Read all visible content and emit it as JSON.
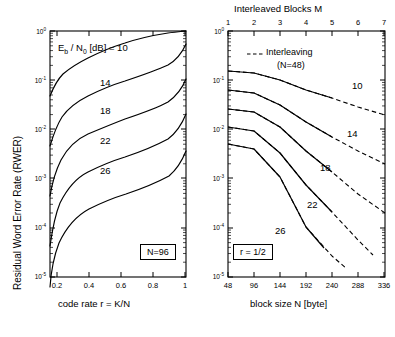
{
  "figure": {
    "left_panel": {
      "xlabel": "code rate   r = K/N",
      "ylabel": "Residual Word Error Rate (RWER)",
      "xticks": [
        "0.2",
        "0.4",
        "0.6",
        "0.8",
        "1"
      ],
      "yticks": [
        "10",
        "10",
        "10",
        "10",
        "10",
        "10"
      ],
      "yexp": [
        "0",
        "-1",
        "-2",
        "-3",
        "-4",
        "-5"
      ],
      "annotation_prefix": "E",
      "annotation_sub": "b",
      "annotation_mid": " / N",
      "annotation_sub2": "0",
      "annotation_suffix": " [dB] = 10",
      "box_note": "N=96",
      "curve_labels": [
        "14",
        "18",
        "22",
        "26"
      ]
    },
    "right_panel": {
      "title": "Interleaved Blocks M",
      "xlabel": "block size N [byte]",
      "xticks": [
        "48",
        "96",
        "144",
        "192",
        "240",
        "288",
        "336"
      ],
      "topticks": [
        "1",
        "2",
        "3",
        "4",
        "5",
        "6",
        "7"
      ],
      "yticks": [
        "10",
        "10",
        "10",
        "10",
        "10",
        "10"
      ],
      "yexp": [
        "0",
        "-1",
        "-2",
        "-3",
        "-4",
        "-5"
      ],
      "legend_line1": "Interleaving",
      "legend_line2": "(N=48)",
      "box_note": "r = 1/2",
      "curve_labels": [
        "10",
        "14",
        "18",
        "22",
        "26"
      ]
    }
  },
  "chart_data": [
    {
      "type": "line",
      "title": "",
      "xlabel": "code rate   r = K/N",
      "ylabel": "Residual Word Error Rate (RWER)",
      "xlim": [
        0.15,
        1.0
      ],
      "ylim": [
        1e-05,
        1
      ],
      "yscale": "log",
      "grid": false,
      "legend_position": "inline-labels",
      "annotation": "Eb / N0 [dB] = 10",
      "box_note": "N=96",
      "x": [
        0.16,
        0.2,
        0.25,
        0.3,
        0.35,
        0.4,
        0.5,
        0.6,
        0.7,
        0.8,
        0.9,
        0.95,
        1.0
      ],
      "series": [
        {
          "name": "10",
          "values": [
            0.047,
            0.072,
            0.1,
            0.125,
            0.15,
            0.175,
            0.22,
            0.27,
            0.33,
            0.41,
            0.54,
            0.65,
            0.85
          ]
        },
        {
          "name": "14",
          "values": [
            0.0105,
            0.019,
            0.03,
            0.042,
            0.053,
            0.063,
            0.085,
            0.108,
            0.14,
            0.185,
            0.26,
            0.33,
            0.52
          ]
        },
        {
          "name": "18",
          "values": [
            0.0028,
            0.006,
            0.0105,
            0.0152,
            0.0198,
            0.0242,
            0.034,
            0.045,
            0.06,
            0.082,
            0.12,
            0.16,
            0.27
          ]
        },
        {
          "name": "22",
          "values": [
            0.00072,
            0.0018,
            0.0035,
            0.0053,
            0.0072,
            0.009,
            0.0131,
            0.0178,
            0.0245,
            0.0345,
            0.052,
            0.071,
            0.125
          ]
        },
        {
          "name": "26",
          "values": [
            0.00018,
            0.00052,
            0.00112,
            0.00178,
            0.00248,
            0.00318,
            0.0048,
            0.0067,
            0.0094,
            0.0136,
            0.021,
            0.029,
            0.053
          ]
        }
      ]
    },
    {
      "type": "line",
      "title": "Interleaved Blocks M",
      "xlabel": "block size N [byte]",
      "ylabel": "",
      "xlim": [
        48,
        336
      ],
      "ylim": [
        1e-05,
        1
      ],
      "yscale": "log",
      "grid": false,
      "top_axis": {
        "label": "Interleaved Blocks M",
        "ticks": [
          1,
          2,
          3,
          4,
          5,
          6,
          7
        ]
      },
      "legend": [
        "Interleaving (N=48)"
      ],
      "box_note": "r = 1/2",
      "x_solid": [
        48,
        96,
        144,
        192,
        240
      ],
      "x_dashed": [
        48,
        96,
        144,
        192,
        240,
        288,
        336
      ],
      "series": [
        {
          "name": "10",
          "style": "solid",
          "values": [
            0.155,
            0.145,
            0.105,
            0.068,
            0.046
          ]
        },
        {
          "name": "10-interleave",
          "style": "dashed",
          "values": [
            0.155,
            0.145,
            0.105,
            0.068,
            0.046,
            0.031,
            0.021
          ]
        },
        {
          "name": "14",
          "style": "solid",
          "values": [
            0.062,
            0.055,
            0.032,
            0.0145,
            0.0072
          ]
        },
        {
          "name": "14-interleave",
          "style": "dashed",
          "values": [
            0.062,
            0.055,
            0.032,
            0.0145,
            0.0072,
            0.0038,
            0.0021
          ]
        },
        {
          "name": "18",
          "style": "solid",
          "values": [
            0.026,
            0.022,
            0.0105,
            0.0035,
            0.0013
          ]
        },
        {
          "name": "18-interleave",
          "style": "dashed",
          "values": [
            0.026,
            0.022,
            0.0105,
            0.0035,
            0.0013,
            0.00048,
            0.00019
          ]
        },
        {
          "name": "22",
          "style": "solid",
          "values": [
            0.0112,
            0.0092,
            0.0033,
            0.00072,
            0.00021
          ]
        },
        {
          "name": "22-interleave",
          "style": "dashed",
          "values": [
            0.0112,
            0.0092,
            0.0033,
            0.00072,
            0.00021,
            7e-05,
            2.2e-05
          ]
        },
        {
          "name": "26",
          "style": "solid",
          "values": [
            0.0049,
            0.0039,
            0.00092,
            0.00013,
            3.2e-05
          ]
        },
        {
          "name": "26-interleave",
          "style": "dashed",
          "values": [
            0.0049,
            0.0039,
            0.00092,
            0.00013,
            3.2e-05,
            1.15e-05
          ]
        }
      ]
    }
  ]
}
